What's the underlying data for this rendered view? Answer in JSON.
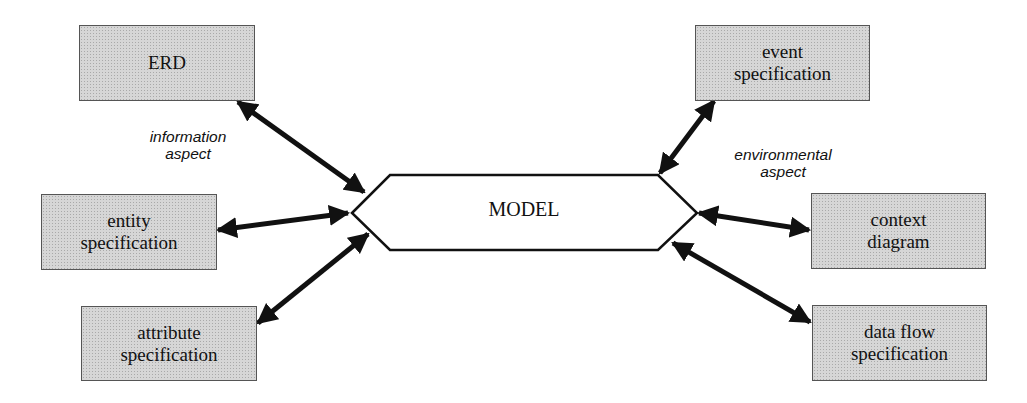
{
  "diagram": {
    "center": {
      "label": "MODEL"
    },
    "aspects": {
      "information": {
        "line1": "information",
        "line2": "aspect"
      },
      "environmental": {
        "line1": "environmental",
        "line2": "aspect"
      }
    },
    "left_nodes": [
      {
        "line1": "ERD",
        "line2": ""
      },
      {
        "line1": "entity",
        "line2": "specification"
      },
      {
        "line1": "attribute",
        "line2": "specification"
      }
    ],
    "right_nodes": [
      {
        "line1": "event",
        "line2": "specification"
      },
      {
        "line1": "context",
        "line2": "diagram"
      },
      {
        "line1": "data flow",
        "line2": "specification"
      }
    ],
    "connectors": [
      {
        "from": "ERD",
        "to": "MODEL",
        "type": "bidirectional"
      },
      {
        "from": "entity specification",
        "to": "MODEL",
        "type": "bidirectional"
      },
      {
        "from": "attribute specification",
        "to": "MODEL",
        "type": "bidirectional"
      },
      {
        "from": "event specification",
        "to": "MODEL",
        "type": "bidirectional"
      },
      {
        "from": "context diagram",
        "to": "MODEL",
        "type": "bidirectional"
      },
      {
        "from": "data flow specification",
        "to": "MODEL",
        "type": "bidirectional"
      }
    ],
    "colors": {
      "box_fill": "#d6d6d6",
      "stroke": "#111111",
      "background": "#ffffff"
    }
  }
}
